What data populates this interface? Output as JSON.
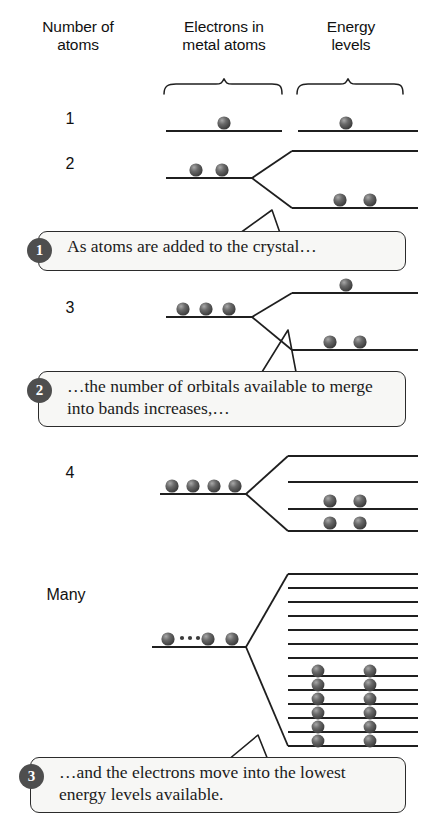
{
  "figure": {
    "type": "diagram"
  },
  "columns": {
    "atoms": "Number of\natoms",
    "atoms_line1": "Number of",
    "atoms_line2": "atoms",
    "electrons_line1": "Electrons in",
    "electrons_line2": "metal atoms",
    "energy_line1": "Energy",
    "energy_line2": "levels"
  },
  "rows": [
    {
      "label": "1",
      "metal_electrons": 1,
      "metal_has_ellipsis": false,
      "energy_levels": [
        {
          "electrons": 1
        }
      ]
    },
    {
      "label": "2",
      "metal_electrons": 2,
      "metal_has_ellipsis": false,
      "energy_levels": [
        {
          "electrons": 0
        },
        {
          "electrons": 2
        }
      ]
    },
    {
      "label": "3",
      "metal_electrons": 3,
      "metal_has_ellipsis": false,
      "energy_levels": [
        {
          "electrons": 1
        },
        {
          "electrons": 2
        }
      ]
    },
    {
      "label": "4",
      "metal_electrons": 4,
      "metal_has_ellipsis": false,
      "energy_levels": [
        {
          "electrons": 0
        },
        {
          "electrons": 0
        },
        {
          "electrons": 2
        },
        {
          "electrons": 2
        }
      ]
    },
    {
      "label": "Many",
      "metal_electrons": 3,
      "metal_has_ellipsis": true,
      "energy_levels": [
        {
          "electrons": 0
        },
        {
          "electrons": 0
        },
        {
          "electrons": 0
        },
        {
          "electrons": 0
        },
        {
          "electrons": 0
        },
        {
          "electrons": 0
        },
        {
          "electrons": 0
        },
        {
          "electrons": 2
        },
        {
          "electrons": 2
        },
        {
          "electrons": 2
        },
        {
          "electrons": 2
        },
        {
          "electrons": 2
        },
        {
          "electrons": 2
        }
      ]
    }
  ],
  "callouts": [
    {
      "number": "1",
      "text": "As atoms are added to the crystal…"
    },
    {
      "number": "2",
      "text": "…the number of orbitals available to merge into bands increases,…"
    },
    {
      "number": "3",
      "text": "…and the electrons move into the lowest energy levels available."
    }
  ],
  "colors": {
    "line": "#1f1f1f",
    "electron_dark": "#4a4a4a",
    "electron_highlight": "#9b9b9b",
    "badge": "#4e4e4e",
    "callout_fill": "#f7f7f5",
    "background": "#ffffff"
  }
}
